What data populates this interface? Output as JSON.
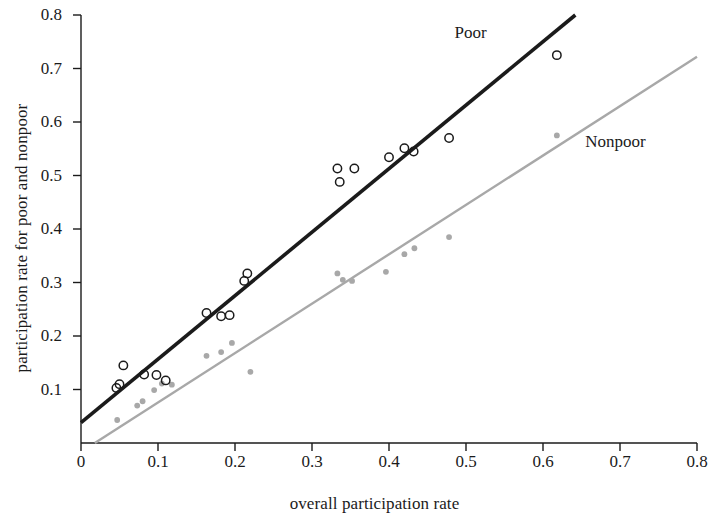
{
  "chart_data": {
    "type": "scatter",
    "title": "",
    "xlabel": "overall participation rate",
    "ylabel": "participation rate for poor and nonpoor",
    "xlim": [
      0,
      0.8
    ],
    "ylim": [
      0,
      0.8
    ],
    "xticks": [
      "0",
      "0.1",
      "0.2",
      "0.3",
      "0.4",
      "0.5",
      "0.6",
      "0.7",
      "0.8"
    ],
    "xtick_values": [
      0,
      0.1,
      0.2,
      0.3,
      0.4,
      0.5,
      0.6,
      0.7,
      0.8
    ],
    "yticks": [
      "0.1",
      "0.2",
      "0.3",
      "0.4",
      "0.5",
      "0.6",
      "0.7",
      "0.8"
    ],
    "ytick_values": [
      0.1,
      0.2,
      0.3,
      0.4,
      0.5,
      0.6,
      0.7,
      0.8
    ],
    "grid": false,
    "legend_position": "inline-annotation",
    "series": [
      {
        "name": "Poor",
        "marker": "open-circle",
        "color": "#1b1b1b",
        "label_text": "Poor",
        "label_x": 0.485,
        "label_y": 0.765,
        "points": [
          {
            "x": 0.046,
            "y": 0.103
          },
          {
            "x": 0.05,
            "y": 0.11
          },
          {
            "x": 0.055,
            "y": 0.145
          },
          {
            "x": 0.082,
            "y": 0.128
          },
          {
            "x": 0.098,
            "y": 0.127
          },
          {
            "x": 0.11,
            "y": 0.117
          },
          {
            "x": 0.163,
            "y": 0.243
          },
          {
            "x": 0.182,
            "y": 0.237
          },
          {
            "x": 0.193,
            "y": 0.239
          },
          {
            "x": 0.212,
            "y": 0.303
          },
          {
            "x": 0.216,
            "y": 0.317
          },
          {
            "x": 0.333,
            "y": 0.513
          },
          {
            "x": 0.336,
            "y": 0.488
          },
          {
            "x": 0.355,
            "y": 0.513
          },
          {
            "x": 0.4,
            "y": 0.534
          },
          {
            "x": 0.42,
            "y": 0.551
          },
          {
            "x": 0.432,
            "y": 0.545
          },
          {
            "x": 0.478,
            "y": 0.57
          },
          {
            "x": 0.618,
            "y": 0.725
          }
        ],
        "fit_line": {
          "x1": 0.0,
          "y1": 0.038,
          "x2": 0.642,
          "y2": 0.8
        }
      },
      {
        "name": "Nonpoor",
        "marker": "filled-dot",
        "color": "#a8a8a8",
        "label_text": "Nonpoor",
        "label_x": 0.655,
        "label_y": 0.56,
        "points": [
          {
            "x": 0.047,
            "y": 0.043
          },
          {
            "x": 0.073,
            "y": 0.07
          },
          {
            "x": 0.08,
            "y": 0.078
          },
          {
            "x": 0.095,
            "y": 0.099
          },
          {
            "x": 0.105,
            "y": 0.111
          },
          {
            "x": 0.118,
            "y": 0.109
          },
          {
            "x": 0.163,
            "y": 0.163
          },
          {
            "x": 0.182,
            "y": 0.17
          },
          {
            "x": 0.196,
            "y": 0.187
          },
          {
            "x": 0.22,
            "y": 0.133
          },
          {
            "x": 0.333,
            "y": 0.317
          },
          {
            "x": 0.34,
            "y": 0.305
          },
          {
            "x": 0.352,
            "y": 0.303
          },
          {
            "x": 0.396,
            "y": 0.32
          },
          {
            "x": 0.42,
            "y": 0.353
          },
          {
            "x": 0.433,
            "y": 0.364
          },
          {
            "x": 0.478,
            "y": 0.385
          },
          {
            "x": 0.618,
            "y": 0.575
          }
        ],
        "fit_line": {
          "x1": 0.018,
          "y1": 0.0,
          "x2": 0.8,
          "y2": 0.722
        }
      }
    ]
  }
}
